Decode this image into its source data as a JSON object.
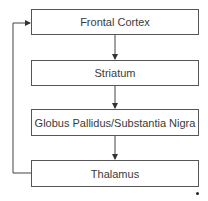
{
  "diagram": {
    "type": "flowchart",
    "nodes": [
      {
        "id": "frontal-cortex",
        "label": "Frontal Cortex"
      },
      {
        "id": "striatum",
        "label": "Striatum"
      },
      {
        "id": "globus-pallidus-substantia-nigra",
        "label": "Globus Pallidus/Substantia Nigra"
      },
      {
        "id": "thalamus",
        "label": "Thalamus"
      }
    ],
    "edges": [
      {
        "from": "frontal-cortex",
        "to": "striatum"
      },
      {
        "from": "striatum",
        "to": "globus-pallidus-substantia-nigra"
      },
      {
        "from": "globus-pallidus-substantia-nigra",
        "to": "thalamus"
      },
      {
        "from": "thalamus",
        "to": "frontal-cortex",
        "kind": "feedback-loop"
      }
    ],
    "colors": {
      "border": "#555555",
      "text": "#3a3a3a",
      "background": "#ffffff"
    }
  }
}
